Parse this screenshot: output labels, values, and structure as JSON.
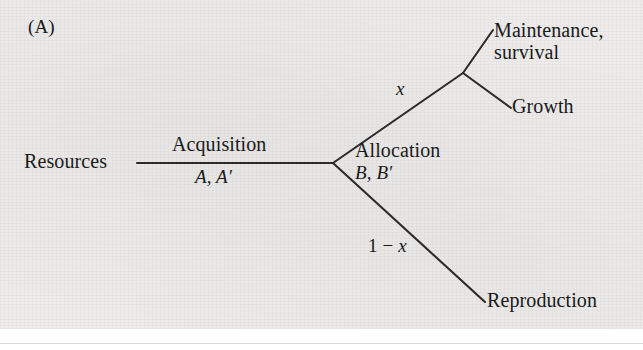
{
  "figure": {
    "panel_label": "(A)",
    "background_color": "#edeceb",
    "line_color": "#2b2b2b",
    "text_color": "#1a1a1a"
  },
  "nodes": {
    "resources": "Resources",
    "maintenance_survival_line1": "Maintenance,",
    "maintenance_survival_line2": "survival",
    "growth": "Growth",
    "reproduction": "Reproduction"
  },
  "edge_labels": {
    "acquisition_name": "Acquisition",
    "acquisition_params": "A, A′",
    "allocation_name": "Allocation",
    "allocation_params": "B, B′",
    "upper_fraction": "x",
    "lower_fraction_prefix": "1 − ",
    "lower_fraction_var": "x"
  },
  "geometry": {
    "trunk_start": [
      137,
      163
    ],
    "fork_node": [
      333,
      163
    ],
    "upper_branch_end": [
      463,
      73
    ],
    "lower_branch_end": [
      485,
      302
    ],
    "subfork_node": [
      463,
      73
    ],
    "maintenance_end": [
      493,
      30
    ],
    "growth_end": [
      511,
      108
    ]
  }
}
